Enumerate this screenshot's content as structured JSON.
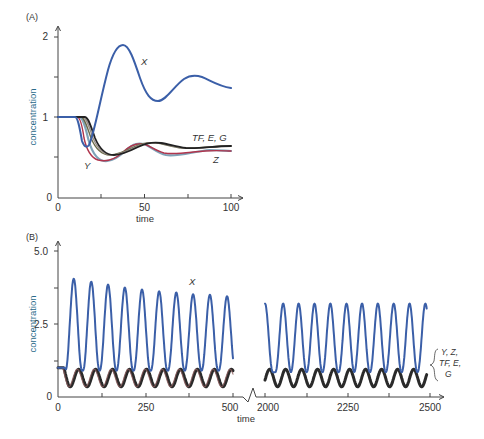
{
  "chart_data": [
    {
      "panel": "(A)",
      "type": "line",
      "title": "",
      "xlabel": "time",
      "ylabel": "concentration",
      "xlim": [
        0,
        100
      ],
      "ylim": [
        0,
        2
      ],
      "xticks": [
        0,
        50,
        100
      ],
      "xminor_ticks": [
        25,
        75
      ],
      "yticks": [
        0,
        1,
        2
      ],
      "yminor_ticks": [
        0.5,
        1.5
      ],
      "grid": false,
      "series": [
        {
          "name": "X",
          "color": "#3b5fa8",
          "x": [
            0,
            10,
            14,
            17,
            20,
            25,
            30,
            35,
            38,
            42,
            48,
            53,
            58,
            64,
            70,
            76,
            80,
            85,
            90,
            95,
            100
          ],
          "values": [
            1.0,
            1.0,
            0.78,
            0.62,
            0.66,
            1.1,
            1.55,
            1.84,
            1.89,
            1.8,
            1.45,
            1.25,
            1.2,
            1.28,
            1.42,
            1.51,
            1.52,
            1.48,
            1.42,
            1.38,
            1.36
          ]
        },
        {
          "name": "Y",
          "color": "#b0354d",
          "x": [
            0,
            11,
            14,
            17,
            21,
            26,
            30,
            36,
            42,
            48,
            53,
            60,
            70,
            80,
            90,
            100
          ],
          "values": [
            1.0,
            1.0,
            0.82,
            0.63,
            0.52,
            0.47,
            0.46,
            0.5,
            0.58,
            0.66,
            0.68,
            0.6,
            0.56,
            0.58,
            0.6,
            0.58
          ]
        },
        {
          "name": "Z",
          "color": "#7fa3b8",
          "x": [
            0,
            12,
            15,
            19,
            23,
            28,
            32,
            38,
            44,
            49,
            54,
            60,
            70,
            80,
            90,
            100
          ],
          "values": [
            1.0,
            1.0,
            0.85,
            0.65,
            0.52,
            0.46,
            0.46,
            0.52,
            0.62,
            0.68,
            0.67,
            0.6,
            0.55,
            0.57,
            0.6,
            0.58
          ]
        },
        {
          "name": "TF",
          "color": "#6b6b4a",
          "x": [
            0,
            13,
            17,
            21,
            25,
            30,
            34,
            40,
            46,
            52,
            56,
            62,
            70,
            80,
            90,
            100
          ],
          "values": [
            1.0,
            1.0,
            0.88,
            0.72,
            0.6,
            0.54,
            0.54,
            0.58,
            0.65,
            0.7,
            0.7,
            0.67,
            0.63,
            0.63,
            0.65,
            0.65
          ]
        },
        {
          "name": "E",
          "color": "#9a8f8a",
          "x": [
            0,
            14,
            18,
            22,
            26,
            31,
            35,
            41,
            47,
            53,
            57,
            63,
            71,
            80,
            90,
            100
          ],
          "values": [
            1.0,
            1.0,
            0.9,
            0.74,
            0.62,
            0.55,
            0.54,
            0.58,
            0.65,
            0.7,
            0.7,
            0.67,
            0.63,
            0.63,
            0.65,
            0.65
          ]
        },
        {
          "name": "G",
          "color": "#222222",
          "x": [
            0,
            15,
            19,
            23,
            27,
            32,
            36,
            42,
            48,
            54,
            58,
            64,
            72,
            80,
            90,
            100
          ],
          "values": [
            1.0,
            1.0,
            0.92,
            0.76,
            0.63,
            0.55,
            0.54,
            0.58,
            0.65,
            0.7,
            0.7,
            0.67,
            0.63,
            0.63,
            0.65,
            0.65
          ]
        }
      ],
      "annotations": [
        "X",
        "Y",
        "Z",
        "TF, E, G"
      ]
    },
    {
      "panel": "(B)",
      "type": "line",
      "title": "",
      "xlabel": "time",
      "ylabel": "concentration",
      "xlim_segments": [
        [
          0,
          500
        ],
        [
          2000,
          2500
        ]
      ],
      "axis_break": true,
      "ylim": [
        0,
        5.0
      ],
      "xticks": [
        0,
        250,
        500,
        2000,
        2250,
        2500
      ],
      "xminor_ticks": [
        125,
        375,
        2125,
        2375
      ],
      "yticks": [
        0,
        2.5,
        5.0
      ],
      "yminor_ticks": [
        1.25,
        3.75
      ],
      "grid": false,
      "series": [
        {
          "name": "X",
          "color": "#3b5fa8",
          "description": "sustained oscillation, period ~48",
          "peak_times_segment1": [
            45,
            95,
            143,
            191,
            240,
            289,
            338,
            386,
            434,
            483
          ],
          "peak_values_segment1": [
            4.05,
            3.95,
            3.85,
            3.75,
            3.68,
            3.62,
            3.58,
            3.52,
            3.5,
            3.45
          ],
          "trough_value_segment1": 0.9,
          "peak_times_segment2": [
            2000,
            2055,
            2102,
            2150,
            2198,
            2247,
            2294,
            2342,
            2390,
            2438,
            2486
          ],
          "peak_value_segment2": 3.2,
          "trough_value_segment2": 0.85
        },
        {
          "name": "Y, Z, TF, E, G",
          "color": "#2a2a2a",
          "description": "low-amplitude oscillation, same period, lagging X",
          "min": 0.35,
          "max": 0.95
        }
      ],
      "annotations": [
        "X",
        "Y, Z, TF, E, G"
      ]
    }
  ],
  "panels": {
    "a": {
      "label": "(A)",
      "ylabel": "concentration",
      "xlabel": "time",
      "yticks": [
        "0",
        "1",
        "2"
      ],
      "xticks": [
        "0",
        "50",
        "100"
      ],
      "labels": {
        "x": "X",
        "y": "Y",
        "z": "Z",
        "tfeg": "TF, E, G"
      }
    },
    "b": {
      "label": "(B)",
      "ylabel": "concentration",
      "xlabel": "time",
      "yticks": [
        "0",
        "2.5",
        "5.0"
      ],
      "xticks": [
        "0",
        "250",
        "500",
        "2000",
        "2250",
        "2500"
      ],
      "labels": {
        "x": "X",
        "group1": "Y, Z,",
        "group2": "TF, E,",
        "group3": "G"
      }
    }
  },
  "colors": {
    "x": "#3b5fa8",
    "y": "#b0354d",
    "z": "#7fa3b8",
    "tf": "#6b6b4a",
    "e": "#9a8f8a",
    "g": "#222222",
    "low_group": "#2a2a2a",
    "low_group_accent": "#8a5a5a",
    "axis": "#444444",
    "ylabel": "#2a6b8a"
  }
}
